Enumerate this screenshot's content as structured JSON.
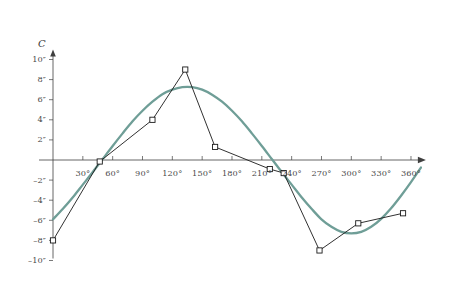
{
  "chart_data": {
    "type": "line",
    "title": "",
    "xlabel": "",
    "ylabel": "C",
    "xlim": [
      0,
      375
    ],
    "ylim": [
      -10,
      11
    ],
    "grid": false,
    "legend": "none",
    "x_unit": "degrees",
    "y_unit": "arcseconds",
    "x_ticks": [
      {
        "value": 30,
        "label": "30°"
      },
      {
        "value": 60,
        "label": "60°"
      },
      {
        "value": 90,
        "label": "90°"
      },
      {
        "value": 120,
        "label": "120°"
      },
      {
        "value": 150,
        "label": "150°"
      },
      {
        "value": 180,
        "label": "180°"
      },
      {
        "value": 210,
        "label": "210°"
      },
      {
        "value": 240,
        "label": "240°"
      },
      {
        "value": 270,
        "label": "270°"
      },
      {
        "value": 300,
        "label": "300°"
      },
      {
        "value": 330,
        "label": "330°"
      },
      {
        "value": 360,
        "label": "360°"
      }
    ],
    "y_ticks": [
      {
        "value": 10,
        "label": "10″"
      },
      {
        "value": 8,
        "label": "8″"
      },
      {
        "value": 6,
        "label": "6″"
      },
      {
        "value": 4,
        "label": "4″"
      },
      {
        "value": 2,
        "label": "2″"
      },
      {
        "value": -2,
        "label": "–2″"
      },
      {
        "value": -4,
        "label": "–4″"
      },
      {
        "value": -6,
        "label": "–6″"
      },
      {
        "value": -8,
        "label": "–8″"
      },
      {
        "value": -10,
        "label": "–10″"
      }
    ],
    "series": [
      {
        "name": "observed",
        "style": "polyline-with-square-markers",
        "color": "#1a1a1a",
        "marker": "open-square",
        "x": [
          0,
          47,
          100,
          133,
          163,
          218,
          232,
          268,
          307,
          352
        ],
        "y": [
          -8.0,
          -0.15,
          4.0,
          9.0,
          1.3,
          -0.9,
          -1.3,
          -9.0,
          -6.3,
          -5.3
        ]
      },
      {
        "name": "fitted-sinusoid",
        "style": "smooth-curve",
        "color": "#6f9e97",
        "marker": "none",
        "amplitude": 7.3,
        "phase_deg": 200,
        "offset": 0.0,
        "x": [
          0,
          10,
          20,
          30,
          40,
          50,
          60,
          70,
          80,
          90,
          100,
          110,
          120,
          130,
          140,
          150,
          160,
          170,
          180,
          190,
          200,
          210,
          220,
          230,
          240,
          250,
          260,
          270,
          280,
          290,
          300,
          310,
          320,
          330,
          340,
          350,
          360,
          370
        ],
        "y": [
          -5.9,
          -4.85,
          -3.7,
          -2.45,
          -1.2,
          0.1,
          1.4,
          2.65,
          3.85,
          4.9,
          5.8,
          6.55,
          7.0,
          7.25,
          7.25,
          7.0,
          6.5,
          5.8,
          4.9,
          3.85,
          2.65,
          1.4,
          0.1,
          -1.2,
          -2.45,
          -3.7,
          -4.85,
          -5.9,
          -6.65,
          -7.15,
          -7.3,
          -7.15,
          -6.65,
          -5.85,
          -4.8,
          -3.55,
          -2.2,
          -0.75
        ]
      }
    ],
    "axis_arrows": {
      "x": true,
      "y": true
    }
  }
}
